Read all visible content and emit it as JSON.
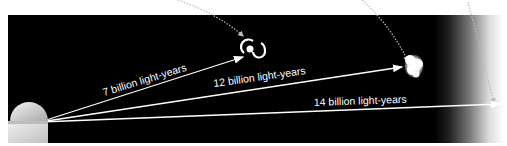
{
  "figure": {
    "type": "distance-diagram",
    "observer": {
      "name": "observatory"
    },
    "arrows": [
      {
        "id": "galaxy",
        "label": "7 billion light-years",
        "target": "spiral-galaxy"
      },
      {
        "id": "blob",
        "label": "12 billion light-years",
        "target": "young-galaxy"
      },
      {
        "id": "edge",
        "label": "14 billion light-years",
        "target": "cosmic-horizon"
      }
    ],
    "colors": {
      "background": "#000000",
      "foreground": "#ffffff",
      "page": "#ffffff"
    }
  }
}
